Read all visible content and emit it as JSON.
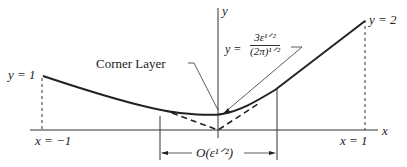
{
  "diagram": {
    "axes": {
      "x_label": "x",
      "y_label": "y"
    },
    "labels": {
      "left_value": "y = 1",
      "right_value": "y = 2",
      "left_x": "x = −1",
      "right_x": "x = 1",
      "corner_layer": "Corner Layer",
      "min_prefix": "y =",
      "min_numerator": "3ε¹ᐟ²",
      "min_denominator": "(2π)¹ᐟ²",
      "width_label": "O(ε¹ᐟ²)"
    },
    "curves": [
      {
        "name": "solution",
        "style": "solid"
      },
      {
        "name": "outer-solution",
        "style": "dashed"
      }
    ]
  }
}
